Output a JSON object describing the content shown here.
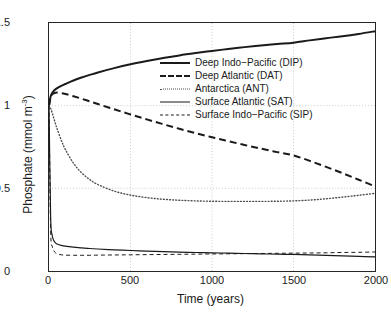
{
  "figure": {
    "width": 391,
    "height": 319,
    "background": "#ffffff",
    "axes_color": "#262626",
    "grid_color": "#bfbfbf"
  },
  "axis": {
    "x_ticks": [
      "0",
      "500",
      "1000",
      "1500",
      "2000"
    ],
    "y_ticks": [
      "0",
      "0.5",
      "1",
      "1.5"
    ],
    "xlabel": "Time (years)",
    "ylabel_text": "Phosphate (mmol m",
    "ylabel_exponent": "-3",
    "ylabel_close": ")"
  },
  "legend": {
    "entries": [
      {
        "label": "Deep Indo−Pacific (DIP)",
        "style": "thick-solid"
      },
      {
        "label": "Deep Atlantic (DAT)",
        "style": "thick-dash"
      },
      {
        "label": "Antarctica (ANT)",
        "style": "dotted"
      },
      {
        "label": "Surface Atlantic (SAT)",
        "style": "thin-solid"
      },
      {
        "label": "Surface Indo−Pacific (SIP)",
        "style": "thin-dash"
      }
    ]
  },
  "chart_data": {
    "type": "line",
    "title": "",
    "xlabel": "Time (years)",
    "ylabel": "Phosphate (mmol m^-3)",
    "xlim": [
      0,
      2000
    ],
    "ylim": [
      0,
      1.5
    ],
    "xticks": [
      0,
      500,
      1000,
      1500,
      2000
    ],
    "yticks": [
      0,
      0.5,
      1,
      1.5
    ],
    "grid": true,
    "grid_style": "dotted",
    "legend_position": "upper-center",
    "x": [
      0,
      10,
      20,
      30,
      40,
      50,
      75,
      100,
      150,
      200,
      250,
      300,
      400,
      500,
      600,
      700,
      800,
      900,
      1000,
      1100,
      1200,
      1300,
      1400,
      1500,
      1600,
      1700,
      1800,
      1900,
      2000
    ],
    "series": [
      {
        "name": "Deep Indo-Pacific (DIP)",
        "abbr": "DIP",
        "style": "thick-solid",
        "color": "#1a1a1a",
        "linewidth": 2.0,
        "values": [
          1.0,
          1.055,
          1.078,
          1.09,
          1.099,
          1.106,
          1.12,
          1.131,
          1.152,
          1.17,
          1.186,
          1.201,
          1.227,
          1.25,
          1.27,
          1.288,
          1.304,
          1.318,
          1.331,
          1.343,
          1.354,
          1.364,
          1.373,
          1.381,
          1.395,
          1.408,
          1.42,
          1.434,
          1.45
        ]
      },
      {
        "name": "Deep Atlantic (DAT)",
        "abbr": "DAT",
        "style": "thick-dash",
        "color": "#1a1a1a",
        "linewidth": 2.0,
        "values": [
          1.0,
          1.05,
          1.068,
          1.075,
          1.078,
          1.079,
          1.076,
          1.071,
          1.057,
          1.042,
          1.026,
          1.01,
          0.978,
          0.947,
          0.917,
          0.888,
          0.86,
          0.834,
          0.809,
          0.785,
          0.762,
          0.74,
          0.719,
          0.699,
          0.666,
          0.63,
          0.592,
          0.552,
          0.512
        ]
      },
      {
        "name": "Antarctica (ANT)",
        "abbr": "ANT",
        "style": "dotted",
        "color": "#4d4d4d",
        "linewidth": 1.4,
        "values": [
          1.0,
          0.985,
          0.955,
          0.922,
          0.89,
          0.86,
          0.792,
          0.736,
          0.652,
          0.594,
          0.553,
          0.523,
          0.483,
          0.459,
          0.444,
          0.434,
          0.428,
          0.424,
          0.422,
          0.421,
          0.421,
          0.421,
          0.422,
          0.424,
          0.429,
          0.437,
          0.447,
          0.458,
          0.47
        ]
      },
      {
        "name": "Surface Atlantic (SAT)",
        "abbr": "SAT",
        "style": "thin-solid",
        "color": "#1a1a1a",
        "linewidth": 1.2,
        "values": [
          1.0,
          0.33,
          0.215,
          0.183,
          0.17,
          0.163,
          0.155,
          0.15,
          0.144,
          0.14,
          0.136,
          0.133,
          0.128,
          0.124,
          0.12,
          0.117,
          0.114,
          0.112,
          0.11,
          0.108,
          0.106,
          0.104,
          0.102,
          0.1,
          0.097,
          0.094,
          0.091,
          0.088,
          0.085
        ]
      },
      {
        "name": "Surface Indo-Pacific (SIP)",
        "abbr": "SIP",
        "style": "thin-dash",
        "color": "#1a1a1a",
        "linewidth": 1.0,
        "values": [
          1.0,
          0.25,
          0.15,
          0.122,
          0.11,
          0.104,
          0.098,
          0.096,
          0.095,
          0.095,
          0.095,
          0.096,
          0.097,
          0.098,
          0.099,
          0.1,
          0.101,
          0.102,
          0.103,
          0.104,
          0.105,
          0.106,
          0.107,
          0.108,
          0.109,
          0.11,
          0.112,
          0.113,
          0.115
        ]
      }
    ]
  }
}
